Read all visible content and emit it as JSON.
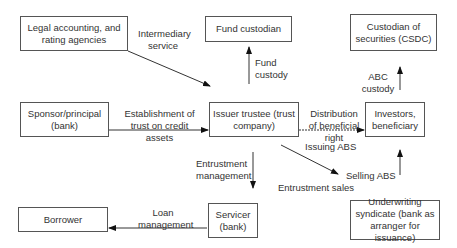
{
  "boxes": {
    "legal": "Legal accounting, and rating agencies",
    "fund_custodian": "Fund custodian",
    "csdc": "Custodian of securities (CSDC)",
    "sponsor": "Sponsor/principal (bank)",
    "issuer": "Issuer trustee (trust company)",
    "investors": "Investors, beneficiary",
    "borrower": "Borrower",
    "servicer": "Servicer (bank)",
    "underwriting": "Underwriting syndicate (bank as arranger for issuance)"
  },
  "labels": {
    "intermediary": "Intermediary service",
    "fund_custody": "Fund custody",
    "abc_custody": "ABC custody",
    "establishment": "Establishment of trust on credit assets",
    "distribution": "Distribution of beneficial right",
    "issuing_abs": "Issuing ABS",
    "selling_abs": "Selling ABS",
    "entrustment_mgmt": "Entrustment management",
    "entrustment_sales": "Entrustment sales",
    "loan_mgmt": "Loan management"
  }
}
